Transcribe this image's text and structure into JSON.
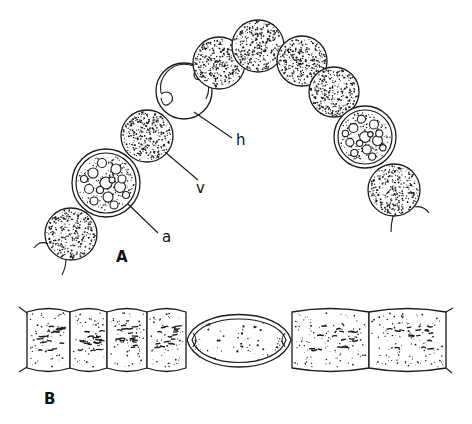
{
  "figure": {
    "panels": [
      {
        "id": "A",
        "label": "A",
        "description": "Curved filament of spherical cells"
      },
      {
        "id": "B",
        "label": "B",
        "description": "Straight filament of cylindrical cells"
      }
    ],
    "annotations": {
      "h": "h",
      "v": "v",
      "a": "a"
    },
    "colors": {
      "ink": "#1a1a1a",
      "background": "#ffffff"
    },
    "filament_a_cells": [
      {
        "type": "vegetative",
        "cx": 71,
        "cy": 234,
        "r": 26
      },
      {
        "type": "akinete",
        "cx": 106,
        "cy": 183,
        "r": 34
      },
      {
        "type": "vegetative",
        "cx": 147,
        "cy": 136,
        "r": 26
      },
      {
        "type": "heterocyst",
        "cx": 184,
        "cy": 91,
        "r": 28
      },
      {
        "type": "vegetative",
        "cx": 219,
        "cy": 63,
        "r": 26
      },
      {
        "type": "vegetative",
        "cx": 258,
        "cy": 46,
        "r": 26
      },
      {
        "type": "vegetative",
        "cx": 302,
        "cy": 61,
        "r": 25
      },
      {
        "type": "vegetative",
        "cx": 334,
        "cy": 92,
        "r": 25
      },
      {
        "type": "akinete",
        "cx": 365,
        "cy": 137,
        "r": 31
      },
      {
        "type": "vegetative",
        "cx": 394,
        "cy": 190,
        "r": 26
      }
    ],
    "filament_b_cells": [
      {
        "type": "vegetative",
        "x0": 27,
        "x1": 70
      },
      {
        "type": "vegetative",
        "x0": 70,
        "x1": 107
      },
      {
        "type": "vegetative",
        "x0": 107,
        "x1": 147
      },
      {
        "type": "vegetative",
        "x0": 147,
        "x1": 186
      },
      {
        "type": "heterocyst",
        "x0": 187,
        "x1": 291
      },
      {
        "type": "vegetative",
        "x0": 292,
        "x1": 369
      },
      {
        "type": "vegetative",
        "x0": 369,
        "x1": 446
      }
    ]
  }
}
